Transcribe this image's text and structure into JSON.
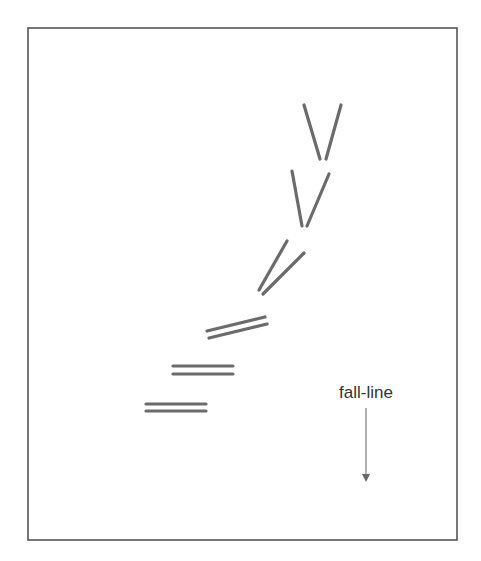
{
  "diagram": {
    "frame": {
      "x": 28,
      "y": 28,
      "width": 429,
      "height": 512
    },
    "ski_color": "#6b6b6b",
    "ski_pairs": [
      {
        "name": "wedge-1",
        "skis": [
          [
            304,
            105,
            320,
            159
          ],
          [
            341,
            105,
            326,
            159
          ]
        ]
      },
      {
        "name": "wedge-2",
        "skis": [
          [
            292,
            171,
            302,
            226
          ],
          [
            329,
            174,
            307,
            226
          ]
        ]
      },
      {
        "name": "wedge-3",
        "skis": [
          [
            287,
            241,
            259,
            290
          ],
          [
            304,
            253,
            263,
            294
          ]
        ]
      },
      {
        "name": "parallel-1",
        "skis": [
          [
            207,
            331,
            265,
            317
          ],
          [
            209,
            338,
            267,
            324
          ]
        ]
      },
      {
        "name": "parallel-2",
        "skis": [
          [
            173,
            366,
            233,
            366
          ],
          [
            173,
            374,
            233,
            374
          ]
        ]
      },
      {
        "name": "parallel-3",
        "skis": [
          [
            146,
            404,
            206,
            404
          ],
          [
            146,
            411,
            206,
            411
          ]
        ]
      }
    ],
    "fall_line": {
      "label": "fall-line",
      "label_x": 366,
      "label_y": 398,
      "arrow": {
        "x": 366,
        "y1": 408,
        "y2": 482
      }
    }
  }
}
